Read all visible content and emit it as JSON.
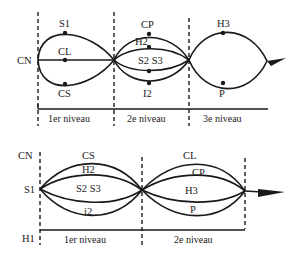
{
  "top_diagram": {
    "start_label": "CN",
    "levels": [
      "1er niveau",
      "2e niveau",
      "3e niveau"
    ],
    "level1": {
      "top": "S1",
      "middle": "CL",
      "bottom": "CS"
    },
    "level2": {
      "top": "CP",
      "upper": "H2",
      "lower": "S2 S3",
      "bottom": "I2"
    },
    "level3": {
      "top": "H3",
      "bottom": "P"
    }
  },
  "bottom_diagram": {
    "left_top_label": "CN",
    "start_label": "S1",
    "left_bottom_label": "H1",
    "levels": [
      "1er niveau",
      "2e niveau"
    ],
    "level1": {
      "top": "CS",
      "upper": "H2",
      "middle": "S2 S3",
      "bottom": "i2"
    },
    "level2": {
      "top": "CL",
      "upper": "CP",
      "middle": "H3",
      "bottom": "P"
    }
  },
  "colors": {
    "ink": "#1a1a1a",
    "background": "#ffffff"
  }
}
